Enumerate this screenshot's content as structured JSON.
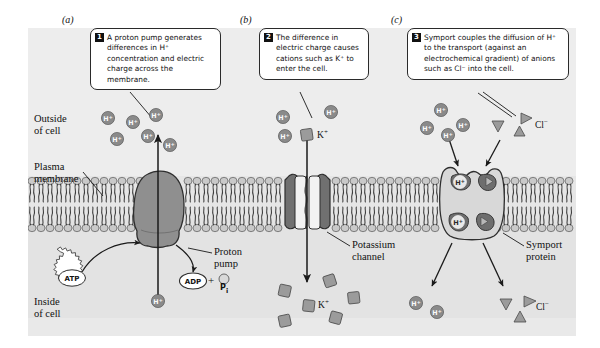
{
  "figure": {
    "background_color": "#e6e6e6",
    "outer_background": "#ffffff"
  },
  "panels": [
    {
      "letter": "(a)",
      "name": "proton-pump-panel"
    },
    {
      "letter": "(b)",
      "name": "potassium-channel-panel"
    },
    {
      "letter": "(c)",
      "name": "symport-panel"
    }
  ],
  "callouts": [
    {
      "number": "1",
      "text": "A proton pump generates differences in H⁺ concentration and electric charge across the membrane."
    },
    {
      "number": "2",
      "text": "The difference in electric charge causes cations such as K⁺ to enter the cell."
    },
    {
      "number": "3",
      "text": "Symport couples the diffusion of H⁺ to the transport (against an electrochemical gradient) of anions such as Cl⁻ into the cell."
    }
  ],
  "region_labels": {
    "outside": "Outside\nof cell",
    "membrane": "Plasma\nmembrane",
    "inside": "Inside\nof cell"
  },
  "structure_labels": [
    {
      "name": "proton-pump-label",
      "text": "Proton\npump"
    },
    {
      "name": "potassium-channel-label",
      "text": "Potassium\nchannel"
    },
    {
      "name": "symport-protein-label",
      "text": "Symport\nprotein"
    }
  ],
  "molecules": {
    "atp": "ATP",
    "adp": "ADP",
    "plus": "+",
    "phosphate": "P",
    "phosphate_sub": "i"
  },
  "ion_labels": {
    "proton": "H",
    "proton_charge": "+",
    "potassium": "K",
    "potassium_charge": "+",
    "chloride": "Cl",
    "chloride_charge": "−"
  },
  "colors": {
    "panel_bg": "#e6e6e6",
    "outside_bg": "#ececec",
    "inside_bg": "#e4e4e4",
    "membrane_head": "#c9c9c9",
    "membrane_head_stroke": "#555555",
    "membrane_tail": "#444444",
    "pump_fill": "#8f8f8f",
    "pump_stroke": "#2e2e2e",
    "channel_fill": "#707070",
    "channel_inner": "#f2f2f2",
    "symport_fill": "#d8d8d8",
    "symport_stroke": "#2e2e2e",
    "ion_proton_fill": "#8a8a8a",
    "ion_potassium_fill": "#9b9b9b",
    "ion_chloride_fill": "#9b9b9b",
    "arrow_stroke": "#1a1a1a",
    "callout_border": "#2a2a2a",
    "callout_num_bg": "#111111",
    "text": "#111111"
  },
  "ions": {
    "protons_outside_a": 6,
    "proton_inside_a": 1,
    "protons_outside_b": 3,
    "potassium_outside_b": 1,
    "potassium_inside_b": 6,
    "protons_outside_c": 4,
    "chloride_outside_c": 3,
    "protons_inside_c": 2,
    "chloride_inside_c": 3,
    "protons_bound_symport": 2,
    "chloride_bound_symport": 2
  }
}
